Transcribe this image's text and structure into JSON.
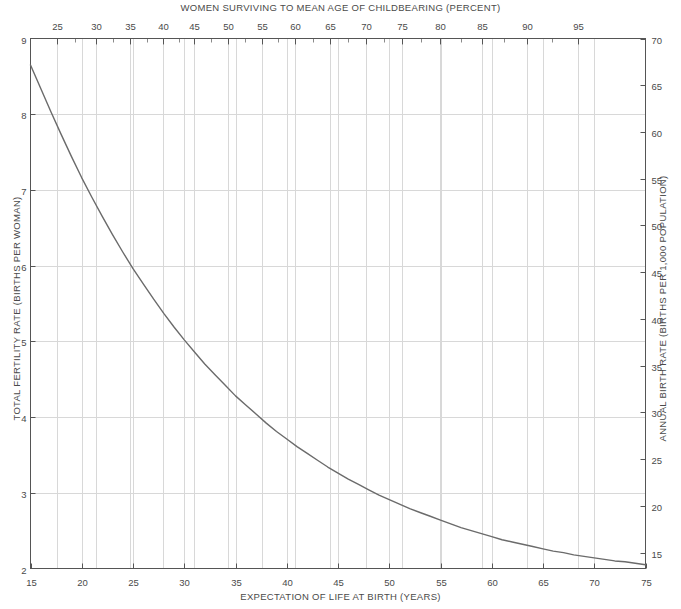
{
  "chart_data": {
    "type": "line",
    "title": "WOMEN SURVIVING TO MEAN AGE OF CHILDBEARING (PERCENT)",
    "subtitle": "",
    "xlabel": "EXPECTATION OF LIFE AT BIRTH (YEARS)",
    "ylabel": "TOTAL FERTILITY RATE (BIRTHS PER WOMAN)",
    "y2label": "ANNUAL BIRTH RATE (BIRTHS PER 1,000 POPULATION)",
    "x2label": "WOMEN SURVIVING TO MEAN AGE OF CHILDBEARING (PERCENT)",
    "xlim": [
      15,
      75
    ],
    "ylim": [
      2,
      9
    ],
    "y2lim": [
      13.3,
      70
    ],
    "grid": true,
    "legend": "none",
    "line_color": "#6b6b6b",
    "grid_color": "#d8d8d8",
    "axis_color": "#555555",
    "background": "#ffffff",
    "xticks": [
      15,
      20,
      25,
      30,
      35,
      40,
      45,
      50,
      55,
      60,
      65,
      70,
      75
    ],
    "xticklabels": [
      "15",
      "20",
      "25",
      "30",
      "35",
      "40",
      "45",
      "50",
      "55",
      "60",
      "65",
      "70",
      "75"
    ],
    "yticks": [
      2,
      3,
      4,
      5,
      6,
      7,
      8,
      9
    ],
    "yticklabels": [
      "2",
      "3",
      "4",
      "5",
      "6",
      "7",
      "8",
      "9"
    ],
    "y2ticks": [
      15,
      20,
      25,
      30,
      35,
      40,
      45,
      50,
      55,
      60,
      65,
      70
    ],
    "y2ticklabels": [
      "15",
      "20",
      "25",
      "30",
      "35",
      "40",
      "45",
      "50",
      "55",
      "60",
      "65",
      "70"
    ],
    "x2ticks": [
      25,
      30,
      35,
      40,
      45,
      50,
      55,
      60,
      65,
      70,
      75,
      80,
      85,
      90,
      95
    ],
    "x2ticklabels": [
      "25",
      "30",
      "35",
      "40",
      "45",
      "50",
      "55",
      "60",
      "65",
      "70",
      "75",
      "80",
      "85",
      "90",
      "95"
    ],
    "x2tick_positions_px": [
      57,
      96,
      130,
      163,
      194,
      228,
      262,
      295,
      330,
      366,
      402,
      440,
      482,
      527,
      578
    ],
    "x2minor_positions_px": [
      75,
      113,
      147,
      179,
      211,
      245,
      278,
      313,
      348,
      384,
      421,
      461,
      504,
      552
    ],
    "series": [
      {
        "name": "Total fertility rate vs expectation of life at birth",
        "x": [
          15,
          16,
          17,
          18,
          19,
          20,
          21,
          22,
          23,
          24,
          25,
          26,
          27,
          28,
          29,
          30,
          31,
          32,
          33,
          34,
          35,
          36,
          37,
          38,
          39,
          40,
          41,
          42,
          43,
          44,
          45,
          46,
          47,
          48,
          49,
          50,
          51,
          52,
          53,
          54,
          55,
          56,
          57,
          58,
          59,
          60,
          61,
          62,
          63,
          64,
          65,
          66,
          67,
          68,
          69,
          70,
          71,
          72,
          73,
          74,
          75
        ],
        "y": [
          8.65,
          8.34,
          8.03,
          7.73,
          7.44,
          7.16,
          6.9,
          6.65,
          6.41,
          6.18,
          5.96,
          5.76,
          5.56,
          5.37,
          5.19,
          5.02,
          4.86,
          4.7,
          4.56,
          4.42,
          4.28,
          4.16,
          4.04,
          3.92,
          3.81,
          3.71,
          3.61,
          3.52,
          3.43,
          3.34,
          3.26,
          3.18,
          3.11,
          3.04,
          2.97,
          2.91,
          2.85,
          2.79,
          2.74,
          2.69,
          2.64,
          2.59,
          2.54,
          2.5,
          2.46,
          2.42,
          2.38,
          2.35,
          2.32,
          2.29,
          2.26,
          2.23,
          2.21,
          2.18,
          2.16,
          2.14,
          2.12,
          2.1,
          2.09,
          2.07,
          2.05
        ]
      }
    ],
    "annotations": []
  }
}
